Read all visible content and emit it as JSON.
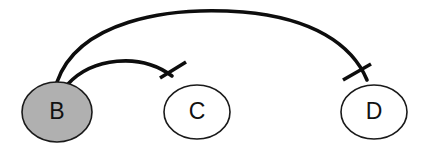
{
  "figure": {
    "width": 426,
    "height": 145,
    "background": "#ffffff"
  },
  "nodes": [
    {
      "id": "B",
      "label": "B",
      "shape": "ellipse",
      "fill": "#b0b0b0",
      "stroke": "#1a1a1a",
      "cx": 57,
      "cy": 112,
      "rx": 35,
      "ry": 30,
      "state": "filled"
    },
    {
      "id": "C",
      "label": "C",
      "shape": "ellipse",
      "fill": "#ffffff",
      "stroke": "#1a1a1a",
      "cx": 197,
      "cy": 112,
      "rx": 33,
      "ry": 27,
      "state": "empty"
    },
    {
      "id": "D",
      "label": "D",
      "shape": "ellipse",
      "fill": "#ffffff",
      "stroke": "#1a1a1a",
      "cx": 374,
      "cy": 112,
      "rx": 33,
      "ry": 27,
      "state": "empty"
    }
  ],
  "edges": [
    {
      "id": "edge-b-c",
      "source": "B",
      "target": "C",
      "type": "inhibition",
      "arrowhead": "tee-bar",
      "stroke": "#0d0d0d",
      "path": "M 68 84 C 92 58 140 52 172 76",
      "tee": {
        "x1": 160,
        "y1": 78,
        "x2": 186,
        "y2": 62
      }
    },
    {
      "id": "edge-b-d",
      "source": "B",
      "target": "D",
      "type": "inhibition",
      "arrowhead": "tee-bar",
      "stroke": "#0d0d0d",
      "path": "M 57 82 C 78 22 165 6 243 12 C 312 18 352 44 367 80",
      "tee": {
        "x1": 343,
        "y1": 80,
        "x2": 371,
        "y2": 64
      }
    }
  ],
  "legend": {
    "edge_semantics": "inhibition",
    "filled_node_meaning": "active"
  }
}
